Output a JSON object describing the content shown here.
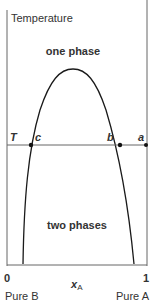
{
  "diagram": {
    "type": "phase-diagram",
    "y_axis_label": "Temperature",
    "x_axis_label": "x",
    "x_axis_label_subscript": "A",
    "x_min_label": "0",
    "x_max_label": "1",
    "x_min_caption": "Pure B",
    "x_max_caption": "Pure A",
    "region_top_label": "one phase",
    "region_bottom_label": "two phases",
    "tie_line_label": "T",
    "points": [
      {
        "id": "c",
        "label": "c",
        "x_fraction": 0.17
      },
      {
        "id": "b",
        "label": "b",
        "x_fraction": 0.81
      },
      {
        "id": "a",
        "label": "a",
        "x_fraction": 1.0
      }
    ],
    "colors": {
      "line": "#1a1a1a",
      "axis": "#555555",
      "text": "#333333"
    }
  }
}
